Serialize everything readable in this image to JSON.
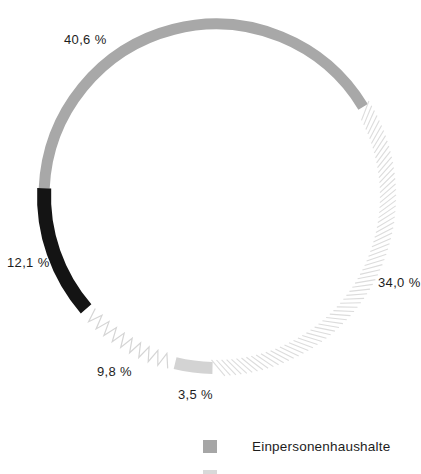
{
  "chart_data": {
    "type": "pie",
    "subtype": "donut-ring",
    "title": "",
    "unit": "%",
    "decimal_separator": ",",
    "total": 100.0,
    "segments": [
      {
        "label": "40,6 %",
        "value": 40.6,
        "style": "solid",
        "color": "#a8a8a8",
        "stroke_width": 11
      },
      {
        "label": "34,0 %",
        "value": 34.0,
        "style": "hatch-lines",
        "color": "#dcdcdc",
        "stroke_width": 16
      },
      {
        "label": "3,5 %",
        "value": 3.5,
        "style": "solid",
        "color": "#d3d3d3",
        "stroke_width": 12
      },
      {
        "label": "9,8 %",
        "value": 9.8,
        "style": "zigzag",
        "color": "#d5d5d5",
        "stroke_width": 14
      },
      {
        "label": "12,1 %",
        "value": 12.1,
        "style": "solid",
        "color": "#141414",
        "stroke_width": 14
      }
    ],
    "legend": {
      "position": "bottom",
      "items": [
        {
          "label": "Einpersonenhaushalte",
          "color": "#a6a6a6"
        }
      ]
    },
    "layout": {
      "cx": 216,
      "cy": 196,
      "r": 172,
      "start_angle_deg": 182.6,
      "direction": "clockwise",
      "grid": false
    }
  }
}
